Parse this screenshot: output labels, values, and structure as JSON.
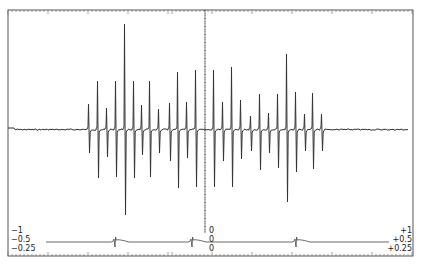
{
  "chart_data": {
    "type": "line",
    "title": "",
    "xlabel": "",
    "ylabel": "",
    "grid": false,
    "legend": null,
    "frame": {
      "left": 8,
      "top": 10,
      "right": 413,
      "bottom": 256
    },
    "baseline_y": 129,
    "center_line_x": 205,
    "spectrum_range_x": [
      8,
      408
    ],
    "peaks": [
      {
        "x": 89,
        "top": 104,
        "bottom": 153
      },
      {
        "x": 98,
        "top": 81,
        "bottom": 178
      },
      {
        "x": 107,
        "top": 108,
        "bottom": 157
      },
      {
        "x": 116,
        "top": 81,
        "bottom": 177
      },
      {
        "x": 125,
        "top": 24,
        "bottom": 215
      },
      {
        "x": 134,
        "top": 81,
        "bottom": 178
      },
      {
        "x": 142,
        "top": 105,
        "bottom": 155
      },
      {
        "x": 150,
        "top": 81,
        "bottom": 177
      },
      {
        "x": 159,
        "top": 109,
        "bottom": 153
      },
      {
        "x": 170,
        "top": 103,
        "bottom": 161
      },
      {
        "x": 178,
        "top": 72,
        "bottom": 188
      },
      {
        "x": 187,
        "top": 102,
        "bottom": 158
      },
      {
        "x": 196,
        "top": 70,
        "bottom": 187
      },
      {
        "x": 214,
        "top": 70,
        "bottom": 187
      },
      {
        "x": 223,
        "top": 102,
        "bottom": 161
      },
      {
        "x": 232,
        "top": 67,
        "bottom": 187
      },
      {
        "x": 241,
        "top": 100,
        "bottom": 159
      },
      {
        "x": 251,
        "top": 116,
        "bottom": 151
      },
      {
        "x": 260,
        "top": 94,
        "bottom": 170
      },
      {
        "x": 269,
        "top": 113,
        "bottom": 153
      },
      {
        "x": 278,
        "top": 94,
        "bottom": 168
      },
      {
        "x": 287,
        "top": 54,
        "bottom": 202
      },
      {
        "x": 296,
        "top": 92,
        "bottom": 172
      },
      {
        "x": 305,
        "top": 114,
        "bottom": 151
      },
      {
        "x": 313,
        "top": 93,
        "bottom": 169
      },
      {
        "x": 322,
        "top": 114,
        "bottom": 151
      }
    ],
    "reference_trace": {
      "y": 242,
      "markers_x": [
        115,
        192,
        296
      ],
      "gap_x": [
        196,
        220
      ]
    },
    "scale_labels": {
      "left": [
        "−1",
        "−0.5",
        "−0.25"
      ],
      "center": [
        "0",
        "0",
        "0"
      ],
      "right": [
        "+1",
        "+0.5",
        "+0.25"
      ]
    },
    "ticks": {
      "minor_spacing": 4,
      "major_spacing": 40.5
    },
    "colors": {
      "line": "#333333",
      "frame": "#555555",
      "ticks": "#777777"
    }
  }
}
